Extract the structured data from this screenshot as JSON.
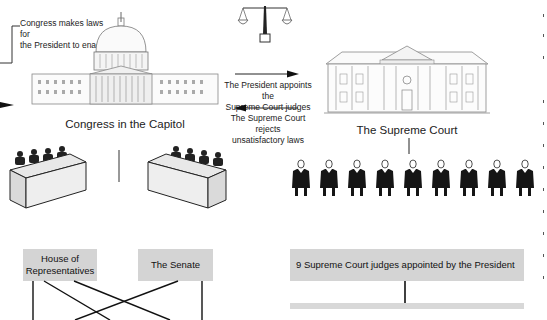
{
  "diagram": {
    "annotations": {
      "congress_makes_laws": "Congress makes laws for the President to enact",
      "president_appoints_line1": "The President appoints the",
      "president_appoints_line2": "Supreme Court  judges",
      "court_rejects_line1": "The Supreme Court rejects",
      "court_rejects_line2": "unsatisfactory laws"
    },
    "congress_line1": "Congress makes laws for",
    "congress_line2": "the President to enact",
    "captions": {
      "capitol": "Congress in the Capitol",
      "supreme_court": "The Supreme Court"
    },
    "boxes": {
      "house_line1": "House of",
      "house_line2": "Representatives",
      "senate": "The Senate",
      "judges": "9 Supreme Court judges appointed by the President"
    },
    "icons": {
      "scales": "scales-of-justice-icon",
      "capitol": "capitol-building-illustration",
      "court": "supreme-court-building-illustration",
      "judges": "judge-figure-icon",
      "congress_desks": "congress-desk-illustration"
    },
    "judge_count": 9,
    "colors": {
      "box_fill": "#d4d4d4",
      "line": "#111111",
      "background": "#ffffff"
    }
  }
}
